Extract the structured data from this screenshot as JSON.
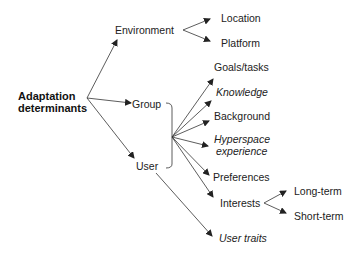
{
  "diagram": {
    "root": {
      "line1": "Adaptation",
      "line2": "determinants"
    },
    "level1": {
      "environment": "Environment",
      "group": "Group",
      "user": "User"
    },
    "environment_children": {
      "location": "Location",
      "platform": "Platform"
    },
    "user_children": {
      "goals": "Goals/tasks",
      "knowledge": "Knowledge",
      "background": "Background",
      "hyperspace1": "Hyperspace",
      "hyperspace2": "experience",
      "preferences": "Preferences",
      "interests": "Interests",
      "user_traits": "User traits"
    },
    "interests_children": {
      "long_term": "Long-term",
      "short_term": "Short-term"
    },
    "colors": {
      "line": "#333333",
      "text": "#222222"
    }
  }
}
